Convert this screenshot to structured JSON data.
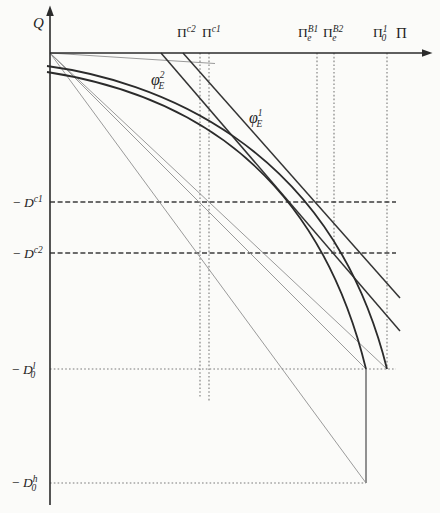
{
  "figure": {
    "kind": "economics-diagram",
    "curve_count": 2,
    "ray_count": 3
  },
  "axes": {
    "vertical_label": "Q",
    "horizontal_label": "Π"
  },
  "top_ticks": [
    {
      "base": "Π",
      "sup": "c2",
      "sub": ""
    },
    {
      "base": "Π",
      "sup": "c1",
      "sub": ""
    },
    {
      "base": "Π",
      "sup": "B1",
      "sub": "e"
    },
    {
      "base": "Π",
      "sup": "B2",
      "sub": "e"
    },
    {
      "base": "Π",
      "sup": "1",
      "sub": "0"
    }
  ],
  "curve_labels": [
    {
      "base": "φ",
      "sup": "2",
      "sub": "E"
    },
    {
      "base": "φ",
      "sup": "1",
      "sub": "E"
    }
  ],
  "left_ticks": [
    {
      "sign": "− ",
      "base": "D",
      "sup": "c1",
      "sub": ""
    },
    {
      "sign": "− ",
      "base": "D",
      "sup": "c2",
      "sub": ""
    },
    {
      "sign": "− ",
      "base": "D",
      "sup": "l",
      "sub": "0"
    },
    {
      "sign": "− ",
      "base": "D",
      "sup": "h",
      "sub": "0"
    }
  ],
  "colors": {
    "background": "#fbfbf9",
    "axis": "#2b2b2b",
    "curve": "#2b2b2b",
    "phi_line": "#333333",
    "thin_line": "#8f8f8f",
    "dotted_guide": "#7a7a7a",
    "dashed_guide": "#3d3d3d",
    "connector": "#6e6e6e",
    "text": "#1f1f1f"
  }
}
